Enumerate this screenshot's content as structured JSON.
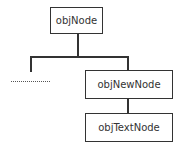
{
  "diagram": {
    "type": "tree",
    "nodes": [
      {
        "id": "root",
        "label": "objNode"
      },
      {
        "id": "new",
        "label": "objNewNode"
      },
      {
        "id": "text",
        "label": "objTextNode"
      }
    ],
    "edges": [
      {
        "from": "root",
        "to": "ellipsis"
      },
      {
        "from": "root",
        "to": "new"
      },
      {
        "from": "new",
        "to": "text"
      }
    ],
    "ellipsis": "......"
  }
}
